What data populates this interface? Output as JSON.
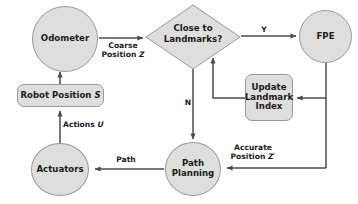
{
  "diagram": {
    "style": {
      "node_fill": "#dededd",
      "node_stroke": "#9a9a9a",
      "line_color": "#4b4b4b",
      "text_color": "#1b1b1b",
      "background": "#ffffff"
    },
    "nodes": {
      "odometer": {
        "label": "Odometer",
        "shape": "circle"
      },
      "close_to_landmarks": {
        "label": "Close to\nLandmarks?",
        "line1": "Close to",
        "line2": "Landmarks?",
        "shape": "diamond"
      },
      "fpe": {
        "label": "FPE",
        "shape": "circle"
      },
      "update_landmark_index": {
        "label": "Update\nLandmark\nIndex",
        "line1": "Update",
        "line2": "Landmark",
        "line3": "Index",
        "shape": "rounded-rect"
      },
      "robot_position": {
        "label": "Robot Position S",
        "text": "Robot Position ",
        "italic": "S",
        "shape": "rounded-rect"
      },
      "actuators": {
        "label": "Actuators",
        "shape": "circle"
      },
      "path_planning": {
        "label": "Path\nPlanning",
        "line1": "Path",
        "line2": "Planning",
        "shape": "circle"
      }
    },
    "edge_labels": {
      "coarse_position": {
        "line1": "Coarse",
        "line2": "Position ",
        "italic": "Z"
      },
      "yes": "Y",
      "no": "N",
      "accurate_position": {
        "line1": "Accurate",
        "line2": "Position ",
        "italic": "Z′"
      },
      "path": "Path",
      "actions": {
        "text": "Actions ",
        "italic": "U"
      }
    },
    "edges": [
      {
        "from": "odometer",
        "to": "close_to_landmarks",
        "label": "Coarse Position Z"
      },
      {
        "from": "close_to_landmarks",
        "to": "fpe",
        "label": "Y"
      },
      {
        "from": "close_to_landmarks",
        "to": "path_planning",
        "label": "N"
      },
      {
        "from": "fpe",
        "to": "update_landmark_index",
        "label": ""
      },
      {
        "from": "fpe",
        "to": "path_planning",
        "label": "Accurate Position Z′"
      },
      {
        "from": "update_landmark_index",
        "to": "close_to_landmarks",
        "label": ""
      },
      {
        "from": "path_planning",
        "to": "actuators",
        "label": "Path"
      },
      {
        "from": "actuators",
        "to": "robot_position",
        "label": "Actions U"
      },
      {
        "from": "robot_position",
        "to": "odometer",
        "label": ""
      }
    ]
  }
}
